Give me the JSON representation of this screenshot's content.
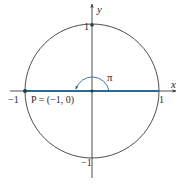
{
  "diagram": {
    "colors": {
      "stroke": "#3a3a3a",
      "highlight": "#2a6a95",
      "background": "#ffffff"
    },
    "axes": {
      "x_label": "x",
      "y_label": "y"
    },
    "ticks": {
      "x_pos": "1",
      "x_neg": "−1",
      "y_pos": "1",
      "y_neg": "−1"
    },
    "angle_label": "π",
    "point_label": "P = (−1, 0)",
    "point": {
      "x": -1,
      "y": 0
    }
  }
}
